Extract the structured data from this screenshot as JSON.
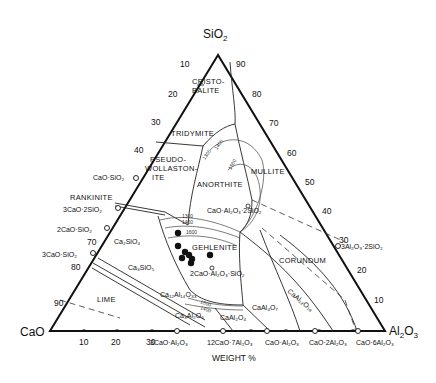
{
  "diagram": {
    "type": "ternary phase diagram",
    "system": "CaO-Al2O3-SiO2",
    "units_label": "WEIGHT %",
    "vertices": {
      "top": {
        "label": "SiO",
        "sub": "2"
      },
      "left": {
        "label": "CaO"
      },
      "right": {
        "label": "Al",
        "sub1": "2",
        "mid": "O",
        "sub2": "3"
      }
    },
    "left_edge_ticks": [
      "10",
      "20",
      "30",
      "40",
      "70",
      "80",
      "90"
    ],
    "right_edge_ticks": [
      "90",
      "80",
      "70",
      "60",
      "50",
      "40",
      "30",
      "20",
      "10"
    ],
    "bottom_edge_ticks": [
      "10",
      "20",
      "30"
    ],
    "primary_fields": [
      {
        "id": "cristobalite",
        "lines": [
          "CRISTO-",
          "BALITE"
        ]
      },
      {
        "id": "tridymite",
        "lines": [
          "TRIDYMITE"
        ]
      },
      {
        "id": "pseudowollastonite",
        "lines": [
          "PSEUDO-",
          "WOLLASTON-",
          "ITE"
        ]
      },
      {
        "id": "anorthite",
        "lines": [
          "ANORTHITE"
        ]
      },
      {
        "id": "mullite",
        "lines": [
          "MULLITE"
        ]
      },
      {
        "id": "rankinite",
        "lines": [
          "RANKINITE"
        ]
      },
      {
        "id": "gehlenite",
        "lines": [
          "GEHLENITE"
        ]
      },
      {
        "id": "corundum",
        "lines": [
          "CORUNDUM"
        ]
      },
      {
        "id": "lime",
        "lines": [
          "LIME"
        ]
      }
    ],
    "compounds_left_edge": [
      "CaO·SiO₂",
      "3CaO·2SiO₂",
      "2CaO·SiO₂",
      "3CaO·SiO₂"
    ],
    "compounds_bottom_edge": [
      "3CaO·Al₂O₃",
      "12CaO·7Al₂O₃",
      "CaO·Al₂O₃",
      "CaO·2Al₂O₃",
      "CaO·6Al₂O₃"
    ],
    "compounds_interior": [
      "CaO·Al₂O₃·2SiO₂",
      "2CaO·Al₂O₃·SiO₂",
      "3Al₂O₃·2SiO₂"
    ],
    "field_formulas": [
      "Ca₂SiO₄",
      "Ca₃SiO₅",
      "Ca₁₂Al₁₄O₃₃",
      "Ca₃Al₂O₆",
      "CaAl₂O₄",
      "CaAl₄O₇",
      "CaAl₁₂O₁₉"
    ],
    "isotherms": [
      "1300",
      "1400",
      "1500",
      "1600"
    ],
    "data_points_count": 8
  }
}
